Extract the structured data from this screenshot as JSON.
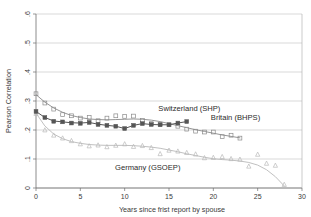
{
  "chart_data": {
    "type": "scatter",
    "title": "",
    "xlabel": "Years since frist report by spouse",
    "ylabel": "Pearson Correlation",
    "xlim": [
      0,
      30
    ],
    "ylim": [
      0,
      0.6
    ],
    "xticks": [
      0,
      5,
      10,
      15,
      20,
      25,
      30
    ],
    "xticklabels": [
      "0",
      "5",
      "10",
      "15",
      "20",
      "25",
      "30"
    ],
    "yticks": [
      0,
      0.1,
      0.2,
      0.3,
      0.4,
      0.5,
      0.6
    ],
    "yticklabels": [
      "0",
      ".1",
      ".2",
      ".3",
      ".4",
      ".5",
      ".6"
    ],
    "grid": "horizontal",
    "legend_position": "inline-annotations",
    "series": [
      {
        "name": "Switzerland (SHP)",
        "color": "#8a8a8a",
        "marker": "open-square",
        "label_x": 17.3,
        "label_y": 0.265,
        "x": [
          0,
          1,
          2,
          3,
          4,
          5,
          6,
          7,
          8,
          9,
          10,
          11,
          12,
          13,
          14,
          15,
          16,
          17,
          18,
          19,
          20,
          21,
          22,
          23
        ],
        "y": [
          0.325,
          0.293,
          0.272,
          0.253,
          0.249,
          0.241,
          0.243,
          0.232,
          0.241,
          0.249,
          0.247,
          0.248,
          0.233,
          0.222,
          0.22,
          0.218,
          0.213,
          0.203,
          0.196,
          0.193,
          0.193,
          0.177,
          0.182,
          0.172
        ],
        "fit_y": [
          0.322,
          0.296,
          0.276,
          0.261,
          0.25,
          0.243,
          0.238,
          0.236,
          0.235,
          0.236,
          0.237,
          0.238,
          0.237,
          0.234,
          0.229,
          0.222,
          0.215,
          0.208,
          0.201,
          0.195,
          0.189,
          0.183,
          0.178,
          0.173
        ]
      },
      {
        "name": "Britain (BHPS)",
        "color": "#555555",
        "marker": "filled-square",
        "label_x": 22.5,
        "label_y": 0.233,
        "x": [
          0,
          1,
          2,
          3,
          4,
          5,
          6,
          7,
          8,
          9,
          10,
          11,
          12,
          13,
          14,
          15,
          16,
          17
        ],
        "y": [
          0.264,
          0.243,
          0.23,
          0.228,
          0.224,
          0.223,
          0.226,
          0.219,
          0.216,
          0.213,
          0.205,
          0.216,
          0.222,
          0.219,
          0.218,
          0.218,
          0.224,
          0.229
        ],
        "fit_y": [
          0.264,
          0.243,
          0.231,
          0.228,
          0.225,
          0.224,
          0.226,
          0.22,
          0.216,
          0.213,
          0.205,
          0.216,
          0.222,
          0.219,
          0.218,
          0.218,
          0.224,
          0.229
        ]
      },
      {
        "name": "Germany (GSOEP)",
        "color": "#b9b9b9",
        "marker": "open-triangle",
        "label_x": 12.6,
        "label_y": 0.062,
        "x": [
          0,
          1,
          2,
          3,
          4,
          5,
          6,
          7,
          8,
          9,
          10,
          11,
          12,
          13,
          14,
          15,
          16,
          17,
          18,
          19,
          20,
          21,
          22,
          23,
          24,
          25,
          26,
          27,
          28
        ],
        "y": [
          0.257,
          0.2,
          0.182,
          0.172,
          0.163,
          0.152,
          0.145,
          0.148,
          0.142,
          0.147,
          0.152,
          0.143,
          0.146,
          0.139,
          0.118,
          0.13,
          0.127,
          0.122,
          0.117,
          0.104,
          0.105,
          0.108,
          0.101,
          0.099,
          0.075,
          0.116,
          0.085,
          0.078,
          0.012
        ],
        "fit_y": [
          0.258,
          0.214,
          0.186,
          0.17,
          0.16,
          0.154,
          0.15,
          0.148,
          0.147,
          0.147,
          0.147,
          0.146,
          0.144,
          0.141,
          0.137,
          0.131,
          0.125,
          0.118,
          0.112,
          0.106,
          0.101,
          0.098,
          0.096,
          0.093,
          0.088,
          0.079,
          0.063,
          0.039,
          0.007
        ]
      }
    ]
  }
}
